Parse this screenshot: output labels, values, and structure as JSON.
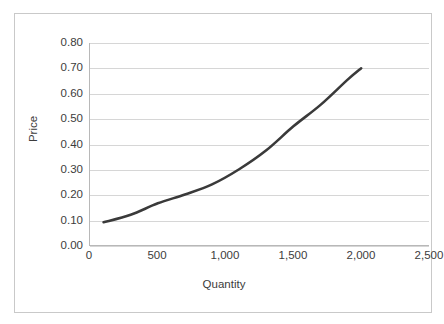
{
  "chart_data": {
    "type": "line",
    "title": "",
    "xlabel": "Quantity",
    "ylabel": "Price",
    "xlim": [
      0,
      2500
    ],
    "ylim": [
      0.0,
      0.8
    ],
    "grid": "horizontal",
    "legend": "none",
    "series": [
      {
        "name": "Supply curve",
        "color": "#3a3a3a",
        "x": [
          100,
          300,
          500,
          700,
          900,
          1100,
          1300,
          1500,
          1700,
          1900,
          2000
        ],
        "y": [
          0.09,
          0.12,
          0.165,
          0.2,
          0.24,
          0.3,
          0.375,
          0.47,
          0.555,
          0.655,
          0.7
        ]
      }
    ],
    "x_ticks": [
      {
        "value": 0,
        "label": "0"
      },
      {
        "value": 500,
        "label": "500"
      },
      {
        "value": 1000,
        "label": "1,000"
      },
      {
        "value": 1500,
        "label": "1,500"
      },
      {
        "value": 2000,
        "label": "2,000"
      },
      {
        "value": 2500,
        "label": "2,500"
      }
    ],
    "y_ticks": [
      {
        "value": 0.8,
        "label": "0.80"
      },
      {
        "value": 0.7,
        "label": "0.70"
      },
      {
        "value": 0.6,
        "label": "0.60"
      },
      {
        "value": 0.5,
        "label": "0.50"
      },
      {
        "value": 0.4,
        "label": "0.40"
      },
      {
        "value": 0.3,
        "label": "0.30"
      },
      {
        "value": 0.2,
        "label": "0.20"
      },
      {
        "value": 0.1,
        "label": "0.10"
      },
      {
        "value": 0.0,
        "label": "0.00"
      }
    ]
  },
  "colors": {
    "curve": "#3a3a3a",
    "gridline": "#d6d6d6",
    "axis": "#b8b8b8",
    "border": "#c9c9c9",
    "text": "#3c3c3c",
    "background": "#ffffff"
  }
}
